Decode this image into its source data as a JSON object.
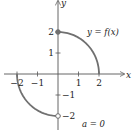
{
  "chart_data": {
    "type": "line",
    "title": "",
    "xlabel": "x",
    "ylabel": "y",
    "xlim": [
      -2.5,
      3
    ],
    "ylim": [
      -2.5,
      3.5
    ],
    "x_ticks": [
      -2,
      -1,
      1,
      2
    ],
    "x_tick_labels": [
      "−2",
      "−1",
      "1",
      "2"
    ],
    "y_ticks": [
      2,
      1,
      -1,
      -2
    ],
    "y_tick_labels": [
      "2",
      "1",
      "−1",
      "−2"
    ],
    "series": [
      {
        "name": "upper quarter circle",
        "description": "y = sqrt(4 - x^2) for 0 <= x <= 2",
        "points": [
          [
            0,
            2
          ],
          [
            0.5,
            1.936
          ],
          [
            1,
            1.732
          ],
          [
            1.5,
            1.323
          ],
          [
            1.8,
            0.872
          ],
          [
            2,
            0
          ]
        ],
        "start_marker": "filled",
        "start_point": [
          0,
          2
        ]
      },
      {
        "name": "lower quarter circle",
        "description": "y = -sqrt(4 - x^2) for -2 <= x < 0",
        "points": [
          [
            -2,
            0
          ],
          [
            -1.8,
            -0.872
          ],
          [
            -1.5,
            -1.323
          ],
          [
            -1,
            -1.732
          ],
          [
            -0.5,
            -1.936
          ],
          [
            0,
            -2
          ]
        ],
        "end_marker": "open",
        "end_point": [
          0,
          -2
        ]
      }
    ],
    "annotations": [
      {
        "text": "y = f(x)"
      },
      {
        "text": "a = 0"
      }
    ],
    "grid": false,
    "legend": "none"
  },
  "labels": {
    "x_axis": "x",
    "y_axis": "y",
    "function_label": "y = f(x)",
    "a_label": "a = 0"
  },
  "colors": {
    "curve": "#707070",
    "axis": "#555555",
    "text": "#222222"
  }
}
